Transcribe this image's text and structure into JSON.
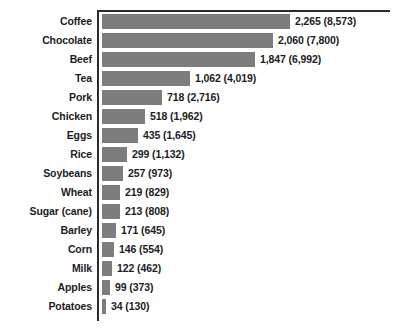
{
  "chart_data": {
    "type": "bar",
    "orientation": "horizontal",
    "title": "",
    "subtitle": "",
    "xlabel": "",
    "ylabel": "",
    "grid": false,
    "legend": null,
    "axis": {
      "top_rule": true,
      "left_rule": true,
      "tick_labels": []
    },
    "value_label_format": "primary (secondary)",
    "xlim": [
      0,
      2265
    ],
    "categories": [
      "Coffee",
      "Chocolate",
      "Beef",
      "Tea",
      "Pork",
      "Chicken",
      "Eggs",
      "Rice",
      "Soybeans",
      "Wheat",
      "Sugar (cane)",
      "Barley",
      "Corn",
      "Milk",
      "Apples",
      "Potatoes"
    ],
    "values": [
      2265,
      2060,
      1847,
      1062,
      718,
      518,
      435,
      299,
      257,
      219,
      213,
      171,
      146,
      122,
      99,
      34
    ],
    "secondary_values": [
      8573,
      7800,
      6992,
      4019,
      2716,
      1962,
      1645,
      1132,
      973,
      829,
      808,
      645,
      554,
      462,
      373,
      130
    ],
    "value_labels": [
      "2,265 (8,573)",
      "2,060 (7,800)",
      "1,847 (6,992)",
      "1,062 (4,019)",
      "718 (2,716)",
      "518 (1,962)",
      "435 (1,645)",
      "299 (1,132)",
      "257 (973)",
      "219 (829)",
      "213 (808)",
      "171 (645)",
      "146 (554)",
      "122 (462)",
      "99 (373)",
      "34 (130)"
    ],
    "colors": {
      "bar": "#7d7d7d",
      "axis": "#2b2b2b",
      "text": "#1c1c1c",
      "background": "#ffffff"
    }
  }
}
